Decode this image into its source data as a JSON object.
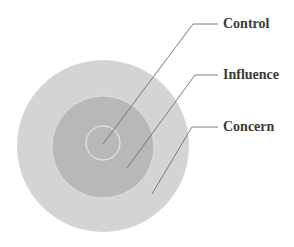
{
  "diagram": {
    "colors": {
      "background": "#ffffff",
      "outer_circle": "#d4d4d4",
      "middle_circle": "#b8b8b8",
      "inner_circle": "#b8b8b8",
      "inner_outline": "#f2f2f2",
      "leader_line": "#6e6e6e",
      "label_text": "#3a3a3a"
    },
    "circles": [
      {
        "name": "concern",
        "cx": 103,
        "cy": 146,
        "r": 86
      },
      {
        "name": "influence",
        "cx": 103,
        "cy": 147,
        "r": 51
      },
      {
        "name": "control",
        "cx": 103,
        "cy": 143,
        "r": 17
      }
    ],
    "labels": [
      {
        "text": "Control",
        "x": 223,
        "y": 17,
        "line": [
          [
            103,
            144
          ],
          [
            193,
            24
          ],
          [
            218,
            24
          ]
        ]
      },
      {
        "text": "Influence",
        "x": 223,
        "y": 68,
        "line": [
          [
            127,
            168
          ],
          [
            195,
            75
          ],
          [
            218,
            75
          ]
        ]
      },
      {
        "text": "Concern",
        "x": 223,
        "y": 120,
        "line": [
          [
            152,
            194
          ],
          [
            192,
            127
          ],
          [
            218,
            127
          ]
        ]
      }
    ]
  }
}
